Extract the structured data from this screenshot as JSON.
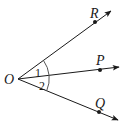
{
  "figure": {
    "type": "angle-diagram",
    "vertex": {
      "label": "O",
      "x": 18,
      "y": 79
    },
    "rays": [
      {
        "name": "OR",
        "point_label": "R",
        "point": [
          95,
          22
        ],
        "tip": [
          111,
          11
        ],
        "label_pos": [
          92,
          19
        ]
      },
      {
        "name": "OP",
        "point_label": "P",
        "point": [
          100,
          70
        ],
        "tip": [
          119,
          67
        ],
        "label_pos": [
          97,
          65
        ]
      },
      {
        "name": "OQ",
        "point_label": "Q",
        "point": [
          99,
          112
        ],
        "tip": [
          118,
          120
        ],
        "label_pos": [
          96,
          108
        ]
      }
    ],
    "angles": [
      {
        "label": "1",
        "between": [
          "OR",
          "OP"
        ],
        "label_pos": [
          36,
          77
        ]
      },
      {
        "label": "2",
        "between": [
          "OP",
          "OQ"
        ],
        "label_pos": [
          40,
          90
        ]
      }
    ],
    "arc_radius": 31,
    "colors": {
      "stroke": "#1a1a1a",
      "arc": "#555555",
      "background": "#ffffff"
    }
  }
}
